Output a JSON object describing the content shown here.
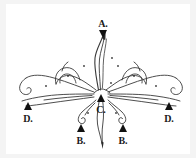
{
  "figure": {
    "kind": "decorative-flourish-diagram",
    "title": "",
    "background_color": "#f4f4f4",
    "canvas_color": "#ffffff",
    "ink_color": "#3a3a3a",
    "marker_color": "#111111",
    "width": 196,
    "height": 158
  },
  "annotations": [
    {
      "id": "a",
      "label": "A.",
      "marker": "triangle-down",
      "label_position": "above",
      "points_to": "upper-stem-tip"
    },
    {
      "id": "c",
      "label": "C.",
      "marker": "triangle-up",
      "label_position": "below",
      "points_to": "center-junction"
    },
    {
      "id": "b1",
      "label": "B.",
      "marker": "triangle-up",
      "label_position": "below",
      "points_to": "lower-left-curl"
    },
    {
      "id": "b2",
      "label": "B.",
      "marker": "triangle-up",
      "label_position": "below",
      "points_to": "lower-right-curl"
    },
    {
      "id": "d1",
      "label": "D.",
      "marker": "triangle-up",
      "label_position": "below",
      "points_to": "left-sweep-tail"
    },
    {
      "id": "d2",
      "label": "D.",
      "marker": "triangle-up",
      "label_position": "below",
      "points_to": "right-sweep-tail"
    }
  ],
  "ornament": {
    "name": "symmetric-calligraphic-flourish",
    "parts": [
      "upper-stem",
      "left-wing",
      "right-wing",
      "left-sweep-tail",
      "right-sweep-tail",
      "lower-left-curl",
      "lower-right-curl",
      "lower-tail",
      "accent-dots"
    ],
    "symmetry": "bilateral-vertical"
  }
}
